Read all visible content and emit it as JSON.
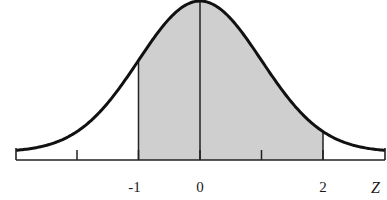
{
  "chart_data": {
    "type": "area",
    "title": "",
    "xlabel": "Z",
    "ylabel": "",
    "x_range": [
      -3,
      3
    ],
    "ticks": [
      -2,
      -1,
      0,
      1,
      2
    ],
    "tick_labels": [
      {
        "value": -1,
        "label": "-1"
      },
      {
        "value": 0,
        "label": "0"
      },
      {
        "value": 2,
        "label": "2"
      }
    ],
    "shaded_region": {
      "from": -1,
      "to": 2
    },
    "vertical_lines": [
      -1,
      0,
      2
    ],
    "grid": false,
    "legend": null,
    "colors": {
      "curve": "#111111",
      "axis": "#222222",
      "shade": "#cfcfcf",
      "background": "#ffffff"
    }
  }
}
